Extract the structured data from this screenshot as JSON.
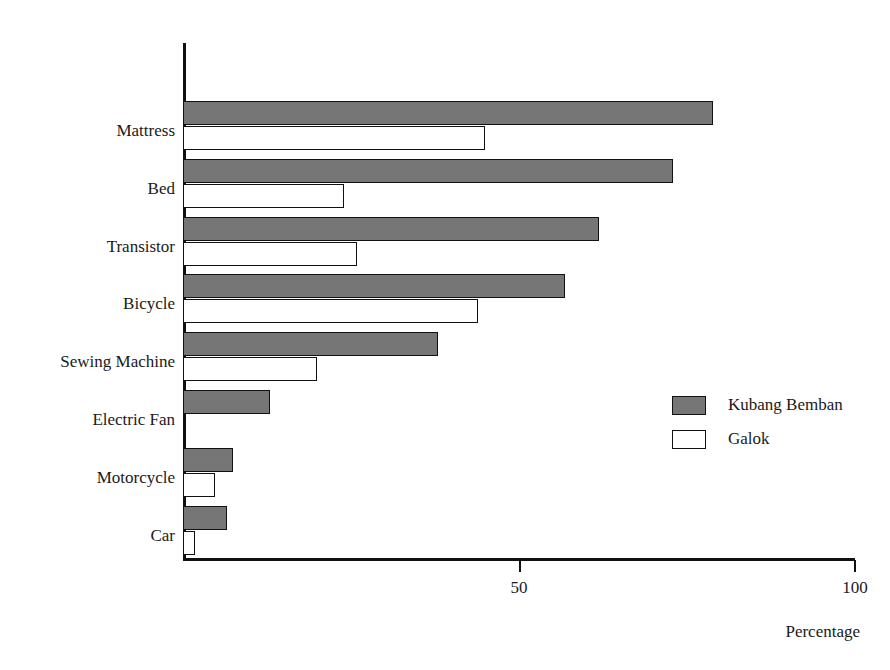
{
  "chart_data": {
    "type": "bar",
    "orientation": "horizontal",
    "title": "",
    "xlabel": "Percentage",
    "ylabel": "",
    "xlim": [
      0,
      100
    ],
    "xticks": [
      50,
      100
    ],
    "xtick_labels": [
      "50",
      "100"
    ],
    "grid": false,
    "legend_position": "center-right",
    "categories": [
      "Mattress",
      "Bed",
      "Transistor",
      "Bicycle",
      "Sewing Machine",
      "Electric Fan",
      "Motorcycle",
      "Car"
    ],
    "series": [
      {
        "name": "Kubang Bemban",
        "color": "#767676",
        "values": [
          79,
          73,
          62,
          57,
          38,
          13,
          7.5,
          6.5
        ]
      },
      {
        "name": "Galok",
        "color": "#ffffff",
        "values": [
          45,
          24,
          26,
          44,
          20,
          0,
          4.8,
          1.8
        ]
      }
    ]
  },
  "legend": {
    "items": [
      {
        "label": "Kubang Bemban",
        "swatch": "filled-gray-swatch"
      },
      {
        "label": "Galok",
        "swatch": "outline-white-swatch"
      }
    ]
  },
  "axis": {
    "x_title": "Percentage",
    "tick_50": "50",
    "tick_100": "100"
  }
}
